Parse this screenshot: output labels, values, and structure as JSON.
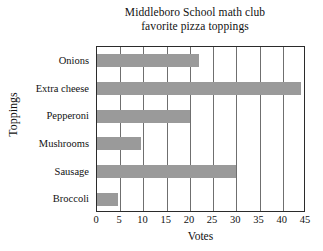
{
  "chart_data": {
    "type": "bar",
    "orientation": "horizontal",
    "title": "Middleboro School math club favorite pizza toppings",
    "title_lines": [
      "Middleboro School math club",
      "favorite pizza toppings"
    ],
    "categories": [
      "Onions",
      "Extra cheese",
      "Pepperoni",
      "Mushrooms",
      "Sausage",
      "Broccoli"
    ],
    "values": [
      22,
      44,
      20,
      9.5,
      30,
      4.5
    ],
    "xlabel": "Votes",
    "ylabel": "Toppings",
    "xlim": [
      0,
      45
    ],
    "xticks": [
      0,
      5,
      10,
      15,
      20,
      25,
      30,
      35,
      40,
      45
    ],
    "xtick_labels": [
      "0",
      "5",
      "10",
      "15",
      "20",
      "25",
      "30",
      "35",
      "40",
      "45"
    ],
    "grid": "vertical",
    "legend": null,
    "bar_color": "#9a9a9a",
    "frame_color": "#2b2b2b",
    "grid_color": "#6f6f6f"
  }
}
